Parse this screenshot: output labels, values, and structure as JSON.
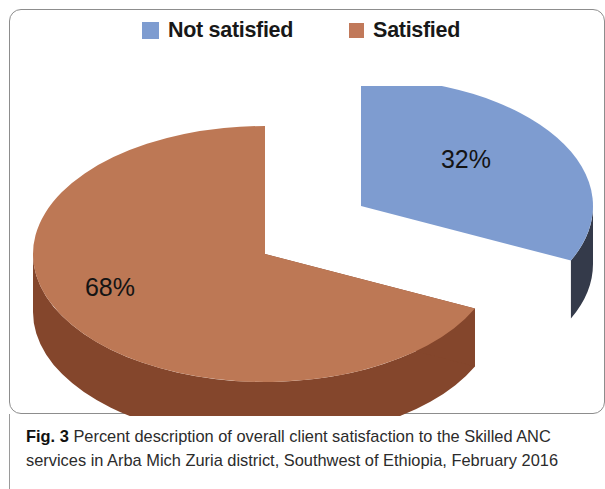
{
  "figure": {
    "caption_label": "Fig. 3",
    "caption_text": "Percent description of overall client satisfaction to the Skilled ANC services in Arba Mich Zuria district, Southwest of Ethiopia, February 2016"
  },
  "legend": {
    "items": [
      {
        "label": "Not satisfied",
        "color": "#7e9cd0",
        "swatch_name": "legend-swatch-not-satisfied"
      },
      {
        "label": "Satisfied",
        "color": "#c1795a",
        "swatch_name": "legend-swatch-satisfied"
      }
    ]
  },
  "chart_data": {
    "type": "pie",
    "title": "",
    "subtitle": "",
    "xlabel": "",
    "ylabel": "",
    "legend_position": "top-center",
    "exploded_slice": "Not satisfied",
    "three_d": true,
    "categories": [
      "Not satisfied",
      "Satisfied"
    ],
    "values": [
      32,
      68
    ],
    "value_labels": [
      "32%",
      "68%"
    ],
    "colors": [
      "#7e9cd0",
      "#bd7855"
    ],
    "side_colors": [
      "#343a4a",
      "#84462c"
    ],
    "slices": [
      {
        "name": "Not satisfied",
        "value": 32,
        "label": "32%",
        "top_color": "#7e9cd0",
        "side_color": "#343a4a",
        "exploded": true
      },
      {
        "name": "Satisfied",
        "value": 68,
        "label": "68%",
        "top_color": "#bd7855",
        "side_color": "#84462c",
        "exploded": false
      }
    ]
  }
}
